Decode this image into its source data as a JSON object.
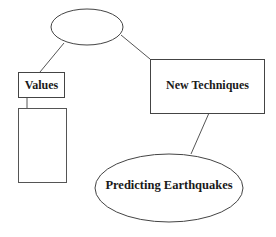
{
  "diagram": {
    "type": "concept-map",
    "nodes": [
      {
        "id": "top",
        "shape": "ellipse",
        "label": ""
      },
      {
        "id": "values",
        "shape": "rect",
        "label": "Values"
      },
      {
        "id": "values-child",
        "shape": "rect",
        "label": ""
      },
      {
        "id": "new-techniques",
        "shape": "rect",
        "label": "New Techniques"
      },
      {
        "id": "predicting",
        "shape": "ellipse",
        "label": "Predicting Earthquakes"
      }
    ],
    "edges": [
      {
        "from": "top",
        "to": "values"
      },
      {
        "from": "top",
        "to": "new-techniques"
      },
      {
        "from": "values",
        "to": "values-child"
      },
      {
        "from": "new-techniques",
        "to": "predicting"
      }
    ],
    "colors": {
      "stroke": "#444444",
      "text": "#1a1a1a",
      "background": "#ffffff"
    }
  }
}
